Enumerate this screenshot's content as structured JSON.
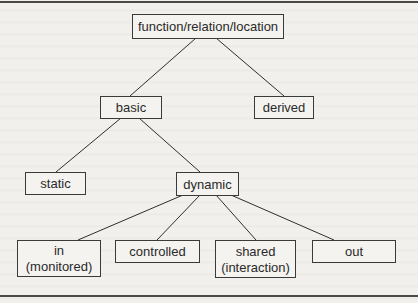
{
  "diagram": {
    "type": "tree",
    "nodes": [
      {
        "id": "root",
        "label": "function/relation/location",
        "lines": [
          "function/relation/location"
        ]
      },
      {
        "id": "basic",
        "label": "basic",
        "lines": [
          "basic"
        ],
        "parent": "root"
      },
      {
        "id": "derived",
        "label": "derived",
        "lines": [
          "derived"
        ],
        "parent": "root"
      },
      {
        "id": "static",
        "label": "static",
        "lines": [
          "static"
        ],
        "parent": "basic"
      },
      {
        "id": "dynamic",
        "label": "dynamic",
        "lines": [
          "dynamic"
        ],
        "parent": "basic"
      },
      {
        "id": "in",
        "label": "in (monitored)",
        "lines": [
          "in",
          "(monitored)"
        ],
        "parent": "dynamic"
      },
      {
        "id": "controlled",
        "label": "controlled",
        "lines": [
          "controlled"
        ],
        "parent": "dynamic"
      },
      {
        "id": "shared",
        "label": "shared (interaction)",
        "lines": [
          "shared",
          "(interaction)"
        ],
        "parent": "dynamic"
      },
      {
        "id": "out",
        "label": "out",
        "lines": [
          "out"
        ],
        "parent": "dynamic"
      }
    ],
    "edges": [
      [
        "root",
        "basic"
      ],
      [
        "root",
        "derived"
      ],
      [
        "basic",
        "static"
      ],
      [
        "basic",
        "dynamic"
      ],
      [
        "dynamic",
        "in"
      ],
      [
        "dynamic",
        "controlled"
      ],
      [
        "dynamic",
        "shared"
      ],
      [
        "dynamic",
        "out"
      ]
    ]
  }
}
